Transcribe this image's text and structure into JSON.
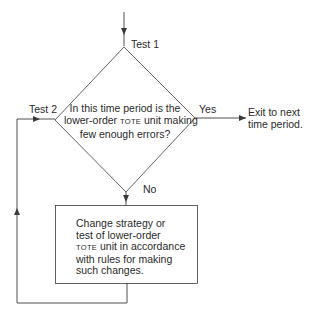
{
  "diagram": {
    "type": "flowchart",
    "labels": {
      "test1": "Test 1",
      "test2": "Test 2",
      "yes": "Yes",
      "no": "No"
    },
    "decision": {
      "line1": "In this time period is the",
      "line2_pre": "lower-order ",
      "line2_sc": "TOTE",
      "line2_post": " unit making",
      "line3": "few enough errors?"
    },
    "exit": {
      "line1": "Exit to next",
      "line2": "time period."
    },
    "process": {
      "line1": "Change strategy or",
      "line2": "test of lower-order",
      "line3_sc": "TOTE",
      "line3_post": " unit in accordance",
      "line4": "with rules for making",
      "line5": "such changes."
    },
    "colors": {
      "stroke": "#3a3a3a",
      "background": "#ffffff"
    }
  }
}
